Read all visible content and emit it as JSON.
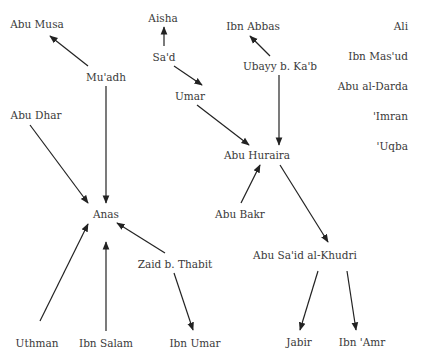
{
  "diagram": {
    "type": "directed-graph",
    "nodes": [
      {
        "id": "aisha",
        "label": "Aisha",
        "x": 163,
        "y": 18
      },
      {
        "id": "sad",
        "label": "Sa'd",
        "x": 164,
        "y": 57
      },
      {
        "id": "abu_musa",
        "label": "Abu Musa",
        "x": 37,
        "y": 24
      },
      {
        "id": "muadh",
        "label": "Mu'adh",
        "x": 106,
        "y": 77
      },
      {
        "id": "abu_dhar",
        "label": "Abu Dhar",
        "x": 36,
        "y": 115
      },
      {
        "id": "umar",
        "label": "Umar",
        "x": 190,
        "y": 96
      },
      {
        "id": "ibn_abbas",
        "label": "Ibn Abbas",
        "x": 253,
        "y": 26
      },
      {
        "id": "ubayy",
        "label": "Ubayy b. Ka'b",
        "x": 280,
        "y": 66
      },
      {
        "id": "abu_huraira",
        "label": "Abu Huraira",
        "x": 257,
        "y": 155
      },
      {
        "id": "abu_bakr",
        "label": "Abu Bakr",
        "x": 240,
        "y": 214
      },
      {
        "id": "anas",
        "label": "Anas",
        "x": 106,
        "y": 214
      },
      {
        "id": "zaid",
        "label": "Zaid b. Thabit",
        "x": 175,
        "y": 264
      },
      {
        "id": "uthman",
        "label": "Uthman",
        "x": 37,
        "y": 343
      },
      {
        "id": "ibn_salam",
        "label": "Ibn Salam",
        "x": 106,
        "y": 343
      },
      {
        "id": "ibn_umar",
        "label": "Ibn Umar",
        "x": 195,
        "y": 343
      },
      {
        "id": "abu_said",
        "label": "Abu Sa'id al-Khudri",
        "x": 305,
        "y": 255
      },
      {
        "id": "jabir",
        "label": "Jabir",
        "x": 299,
        "y": 342
      },
      {
        "id": "ibn_amr",
        "label": "Ibn 'Amr",
        "x": 362,
        "y": 342
      }
    ],
    "isolated": [
      {
        "id": "ali",
        "label": "Ali",
        "x": 408,
        "y": 26
      },
      {
        "id": "ibn_masud",
        "label": "Ibn Mas'ud",
        "x": 408,
        "y": 56
      },
      {
        "id": "abu_darda",
        "label": "Abu al-Darda",
        "x": 408,
        "y": 86
      },
      {
        "id": "imran",
        "label": "'Imran",
        "x": 408,
        "y": 116
      },
      {
        "id": "uqba",
        "label": "'Uqba",
        "x": 408,
        "y": 146
      }
    ],
    "edges": [
      {
        "from": "sad",
        "to": "aisha",
        "x1": 164,
        "y1": 46,
        "x2": 164,
        "y2": 27
      },
      {
        "from": "sad",
        "to": "umar",
        "x1": 174,
        "y1": 66,
        "x2": 202,
        "y2": 85
      },
      {
        "from": "muadh",
        "to": "abu_musa",
        "x1": 88,
        "y1": 66,
        "x2": 50,
        "y2": 36
      },
      {
        "from": "muadh",
        "to": "anas",
        "x1": 106,
        "y1": 86,
        "x2": 106,
        "y2": 203
      },
      {
        "from": "abu_dhar",
        "to": "anas",
        "x1": 30,
        "y1": 125,
        "x2": 88,
        "y2": 203
      },
      {
        "from": "umar",
        "to": "abu_huraira",
        "x1": 197,
        "y1": 105,
        "x2": 249,
        "y2": 145
      },
      {
        "from": "ubayy",
        "to": "ibn_abbas",
        "x1": 270,
        "y1": 56,
        "x2": 250,
        "y2": 36
      },
      {
        "from": "ubayy",
        "to": "abu_huraira",
        "x1": 279,
        "y1": 75,
        "x2": 279,
        "y2": 145
      },
      {
        "from": "abu_bakr",
        "to": "abu_huraira",
        "x1": 241,
        "y1": 203,
        "x2": 260,
        "y2": 165
      },
      {
        "from": "abu_huraira",
        "to": "abu_said",
        "x1": 280,
        "y1": 165,
        "x2": 328,
        "y2": 242
      },
      {
        "from": "zaid",
        "to": "anas",
        "x1": 165,
        "y1": 253,
        "x2": 117,
        "y2": 223
      },
      {
        "from": "uthman",
        "to": "anas",
        "x1": 40,
        "y1": 321,
        "x2": 88,
        "y2": 224
      },
      {
        "from": "ibn_salam",
        "to": "anas",
        "x1": 106,
        "y1": 331,
        "x2": 106,
        "y2": 242
      },
      {
        "from": "zaid",
        "to": "ibn_umar",
        "x1": 174,
        "y1": 273,
        "x2": 193,
        "y2": 330
      },
      {
        "from": "abu_said",
        "to": "jabir",
        "x1": 318,
        "y1": 271,
        "x2": 300,
        "y2": 330
      },
      {
        "from": "abu_said",
        "to": "ibn_amr",
        "x1": 347,
        "y1": 271,
        "x2": 356,
        "y2": 330
      }
    ],
    "colors": {
      "edge": "#222222",
      "text": "#3a3a3a",
      "background": "#ffffff"
    }
  }
}
